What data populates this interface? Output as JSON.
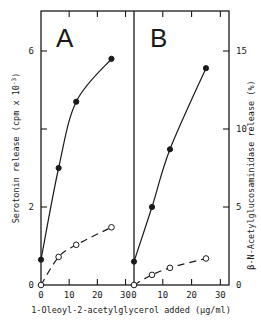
{
  "chart_data": [
    {
      "type": "line",
      "panel": "A",
      "title": "A",
      "xlabel": "1-Oleoyl-2-acetylglycerol added (µg/ml)",
      "ylabel": "Serotonin release (cpm x 10^-3)",
      "x_ticks": [
        "0",
        "10",
        "20",
        "30"
      ],
      "y_ticks": [
        "0",
        "2",
        "",
        "6"
      ],
      "y_tick_values": [
        0,
        2,
        4,
        6
      ],
      "xlim": [
        0,
        33
      ],
      "ylim": [
        0,
        7
      ],
      "grid": false,
      "series": [
        {
          "name": "filled circles (solid line)",
          "marker": "filled",
          "line": "solid",
          "x": [
            0,
            6.25,
            12.5,
            25
          ],
          "y": [
            0.65,
            3.0,
            4.7,
            5.8
          ]
        },
        {
          "name": "open circles (dashed line)",
          "marker": "open",
          "line": "dashed",
          "x": [
            0,
            6.25,
            12.5,
            25
          ],
          "y": [
            0,
            0.72,
            1.03,
            1.48
          ]
        }
      ]
    },
    {
      "type": "line",
      "panel": "B",
      "title": "B",
      "xlabel": "1-Oleoyl-2-acetylglycerol added (µg/ml)",
      "ylabel": "β-N-Acetylglucosaminidase release (%)",
      "x_ticks": [
        "0",
        "10",
        "20",
        "30"
      ],
      "y_ticks": [
        "0",
        "5",
        "10",
        "15"
      ],
      "y_tick_values": [
        0,
        5,
        10,
        15
      ],
      "xlim": [
        0,
        33
      ],
      "ylim": [
        0,
        17.5
      ],
      "grid": false,
      "series": [
        {
          "name": "filled circles (solid line)",
          "marker": "filled",
          "line": "solid",
          "x": [
            0,
            6.25,
            12.5,
            25
          ],
          "y": [
            1.5,
            5.0,
            8.7,
            13.9
          ]
        },
        {
          "name": "open circles (dashed line)",
          "marker": "open",
          "line": "dashed",
          "x": [
            0,
            6.25,
            12.5,
            25
          ],
          "y": [
            0,
            0.65,
            1.1,
            1.7
          ]
        }
      ]
    }
  ],
  "labels": {
    "panel_a": "A",
    "panel_b": "B",
    "y_left_title": "Serotonin release (cpm x 10",
    "y_left_sup": "-3",
    "y_left_close": ")",
    "y_right_title": "β-N-Acetylglucosaminidase release (%)",
    "x_title": "1-Oleoyl-2-acetylglycerol added (µg/ml)",
    "a_y_ticks": [
      "0",
      "2",
      "6"
    ],
    "b_y_ticks": [
      "0",
      "5",
      "10",
      "15"
    ],
    "a_x_ticks": [
      "0",
      "10",
      "20",
      "30"
    ],
    "b_x_ticks": [
      "0",
      "10",
      "20",
      "30"
    ]
  }
}
